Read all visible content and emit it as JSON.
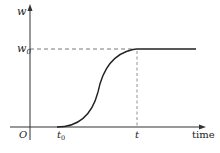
{
  "diagram": {
    "y_axis_label": "w",
    "x_axis_label": "time",
    "origin_label": "O",
    "level_label_main": "w",
    "level_label_sub": "0",
    "start_label_main": "t",
    "start_label_sub": "0",
    "end_label": "t",
    "curve": "sigmoid rising from t0 to w0 at t, then constant",
    "colors": {
      "line": "#222222",
      "dashed": "#555555"
    }
  }
}
